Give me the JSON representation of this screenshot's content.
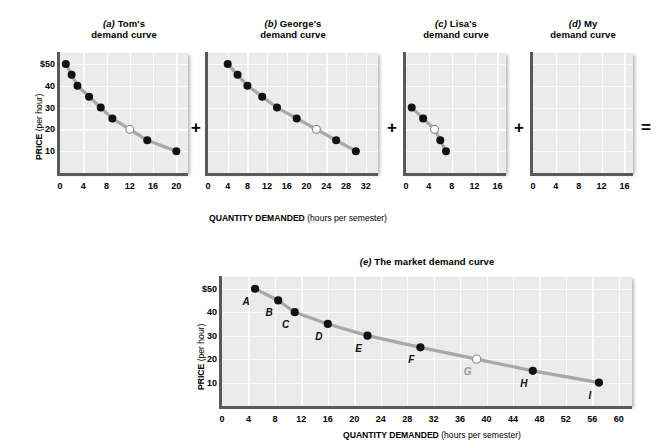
{
  "figure": {
    "axis_labels": {
      "y_title": "PRICE",
      "y_unit": "(per hour)",
      "x_title": "QUANTITY DEMANDED",
      "x_unit": "(hours per semester)"
    },
    "operators": [
      "+",
      "+",
      "+",
      "="
    ]
  },
  "panels": [
    {
      "id": "a",
      "letter": "(a)",
      "title_line1": "Tom's",
      "title_line2": "demand curve",
      "xticks": [
        0,
        4,
        8,
        12,
        16,
        20
      ],
      "yticks": [
        "$50",
        "40",
        "30",
        "20",
        "10"
      ],
      "xmax": 22,
      "ymax": 55
    },
    {
      "id": "b",
      "letter": "(b)",
      "title_line1": "George's",
      "title_line2": "demand curve",
      "xticks": [
        0,
        4,
        8,
        12,
        16,
        20,
        24,
        28,
        32
      ],
      "yticks": [],
      "xmax": 34.5,
      "ymax": 55
    },
    {
      "id": "c",
      "letter": "(c)",
      "title_line1": "Lisa's",
      "title_line2": "demand curve",
      "xticks": [
        0,
        4,
        8,
        12,
        16
      ],
      "yticks": [],
      "xmax": 17.5,
      "ymax": 55
    },
    {
      "id": "d",
      "letter": "(d)",
      "title_line1": "My",
      "title_line2": "demand curve",
      "xticks": [
        0,
        4,
        8,
        12,
        16
      ],
      "yticks": [],
      "xmax": 17.5,
      "ymax": 55
    },
    {
      "id": "e",
      "letter": "(e)",
      "title_line1": "The market demand curve",
      "title_line2": "",
      "xticks": [
        0,
        4,
        8,
        12,
        16,
        20,
        24,
        28,
        32,
        36,
        40,
        44,
        48,
        52,
        56,
        60
      ],
      "yticks": [
        "$50",
        "40",
        "30",
        "20",
        "10"
      ],
      "xmax": 62,
      "ymax": 55
    }
  ],
  "chart_data": [
    {
      "type": "line",
      "panel": "a",
      "title": "(a) Tom's demand curve",
      "xlabel": "QUANTITY DEMANDED (hours per semester)",
      "ylabel": "PRICE (per hour)",
      "xlim": [
        0,
        22
      ],
      "ylim": [
        0,
        55
      ],
      "grid": true,
      "x": [
        1,
        2,
        3,
        5,
        7,
        9,
        12,
        15,
        20
      ],
      "y": [
        50,
        45,
        40,
        35,
        30,
        25,
        20,
        15,
        10
      ],
      "marker_styles": [
        "filled",
        "filled",
        "filled",
        "filled",
        "filled",
        "filled",
        "open",
        "filled",
        "filled"
      ]
    },
    {
      "type": "line",
      "panel": "b",
      "title": "(b) George's demand curve",
      "xlabel": "QUANTITY DEMANDED (hours per semester)",
      "ylabel": "PRICE (per hour)",
      "xlim": [
        0,
        34.5
      ],
      "ylim": [
        0,
        55
      ],
      "grid": true,
      "x": [
        4,
        6,
        8,
        11,
        14,
        18,
        22,
        26,
        30
      ],
      "y": [
        50,
        45,
        40,
        35,
        30,
        25,
        20,
        15,
        10
      ],
      "marker_styles": [
        "filled",
        "filled",
        "filled",
        "filled",
        "filled",
        "filled",
        "open",
        "filled",
        "filled"
      ]
    },
    {
      "type": "line",
      "panel": "c",
      "title": "(c) Lisa's demand curve",
      "xlabel": "QUANTITY DEMANDED (hours per semester)",
      "ylabel": "PRICE (per hour)",
      "xlim": [
        0,
        17.5
      ],
      "ylim": [
        0,
        55
      ],
      "grid": true,
      "x": [
        1,
        3,
        5,
        6,
        7
      ],
      "y": [
        30,
        25,
        20,
        15,
        10
      ],
      "marker_styles": [
        "filled",
        "filled",
        "open",
        "filled",
        "filled"
      ]
    },
    {
      "type": "line",
      "panel": "d",
      "title": "(d) My demand curve",
      "xlabel": "QUANTITY DEMANDED (hours per semester)",
      "ylabel": "PRICE (per hour)",
      "xlim": [
        0,
        17.5
      ],
      "ylim": [
        0,
        55
      ],
      "grid": true,
      "x": [],
      "y": [],
      "marker_styles": []
    },
    {
      "type": "line",
      "panel": "e",
      "title": "(e) The market demand curve",
      "xlabel": "QUANTITY DEMANDED (hours per semester)",
      "ylabel": "PRICE (per hour)",
      "xlim": [
        0,
        62
      ],
      "ylim": [
        0,
        55
      ],
      "grid": true,
      "x": [
        5,
        8.5,
        11,
        16,
        22,
        30,
        38.5,
        47,
        57
      ],
      "y": [
        50,
        45,
        40,
        35,
        30,
        25,
        20,
        15,
        10
      ],
      "point_labels": [
        "A",
        "B",
        "C",
        "D",
        "E",
        "F",
        "G",
        "H",
        "I"
      ],
      "marker_styles": [
        "filled",
        "filled",
        "filled",
        "filled",
        "filled",
        "filled",
        "open",
        "filled",
        "filled"
      ]
    }
  ]
}
